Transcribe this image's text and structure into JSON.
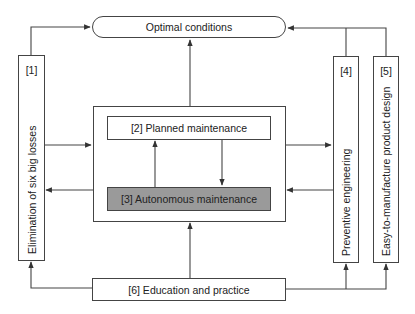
{
  "diagram": {
    "top": {
      "label": "Optimal conditions"
    },
    "pillars": [
      {
        "number": "[1]",
        "label": "Elimination of six big losses"
      },
      {
        "number": "[4]",
        "label": "Preventive engineering"
      },
      {
        "number": "[5]",
        "label": "Easy-to-manufacture product design"
      }
    ],
    "center": {
      "planned": "[2] Planned maintenance",
      "autonomous": "[3] Autonomous maintenance"
    },
    "bottom": {
      "label": "[6] Education and practice"
    },
    "colors": {
      "line": "#444444",
      "autonomous_fill": "#9a9a9a",
      "background": "#ffffff"
    }
  }
}
